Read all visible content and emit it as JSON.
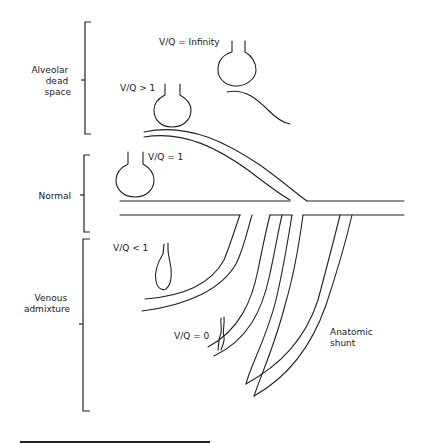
{
  "diagram": {
    "type": "ventilation-perfusion schematic",
    "groups": [
      {
        "label_lines": [
          "Alveolar",
          "dead",
          "space"
        ]
      },
      {
        "label_lines": [
          "Normal"
        ]
      },
      {
        "label_lines": [
          "Venous",
          "admixture"
        ]
      }
    ],
    "units": [
      {
        "label": "V/Q = Infinity"
      },
      {
        "label": "V/Q > 1"
      },
      {
        "label": "V/Q = 1"
      },
      {
        "label": "V/Q < 1"
      },
      {
        "label": "V/Q = 0"
      }
    ],
    "shunt": {
      "label_lines": [
        "Anatomic",
        "shunt"
      ]
    }
  }
}
